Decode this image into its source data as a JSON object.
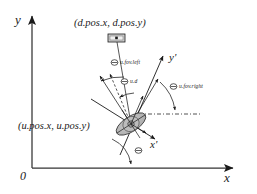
{
  "figure": {
    "type": "diagram",
    "background_color": "#ffffff",
    "stroke_color": "#1a1a1a",
    "fill_color": "#b3b3b3"
  },
  "axes": {
    "x_label": "x",
    "y_label": "y",
    "origin_label": "0",
    "x_prime_label": "x'",
    "y_prime_label": "y'"
  },
  "labels": {
    "device_position": "(d.pos.x, d.pos.y)",
    "user_position": "(u.pos.x, u.pos.y)"
  },
  "angles": [
    {
      "symbol": "Θ",
      "name": "u.fov.left"
    },
    {
      "symbol": "Θ",
      "name": "u.d"
    },
    {
      "symbol": "Θ",
      "name": "u.fov.right"
    },
    {
      "symbol": "Θ",
      "name": ""
    }
  ],
  "icons": {
    "device": "device-rect-icon",
    "user": "user-ellipse-icon"
  }
}
